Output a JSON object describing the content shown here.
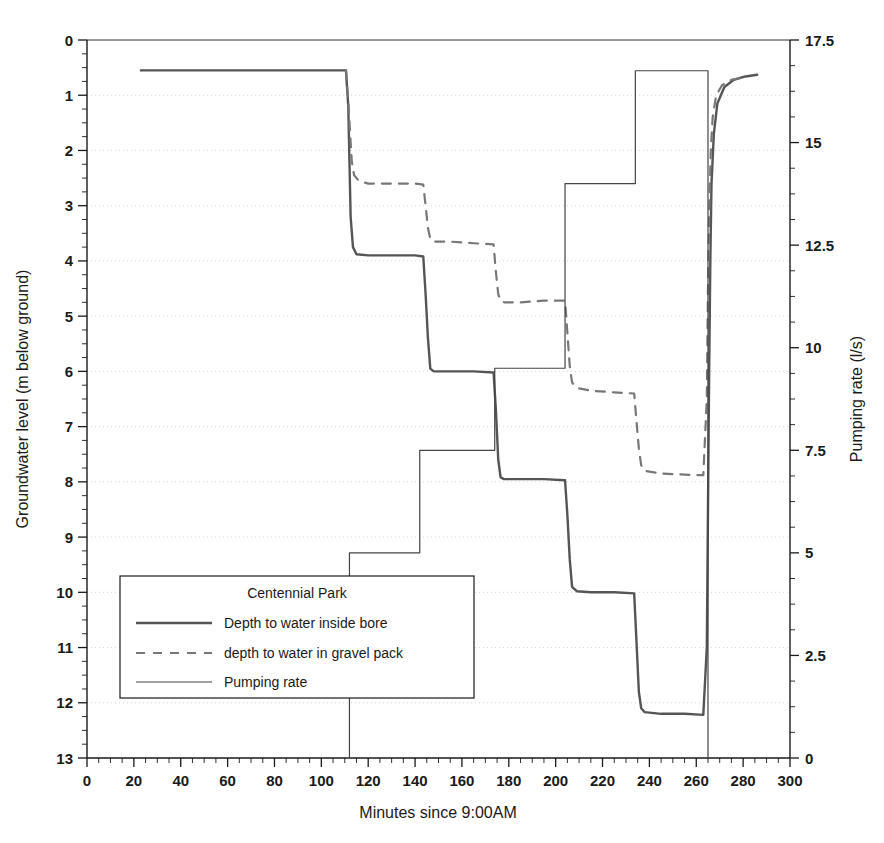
{
  "chart_data": {
    "type": "line",
    "title": "",
    "xlabel": "Minutes since 9:00AM",
    "ylabel_left": "Groundwater level (m below ground)",
    "ylabel_right": "Pumping rate (l/s)",
    "xlim": [
      0,
      300
    ],
    "xticks": [
      0,
      20,
      40,
      60,
      80,
      100,
      120,
      140,
      160,
      180,
      200,
      220,
      240,
      260,
      280,
      300
    ],
    "x_minor_tick_step": 5,
    "ylim_left": [
      0,
      13
    ],
    "yticks_left": [
      0,
      1,
      2,
      3,
      4,
      5,
      6,
      7,
      8,
      9,
      10,
      11,
      12,
      13
    ],
    "y_left_inverted": true,
    "y_left_minor_tick_step": 0.25,
    "ylim_right": [
      0,
      17.5
    ],
    "yticks_right": [
      0,
      2.5,
      5,
      7.5,
      10,
      12.5,
      15,
      17.5
    ],
    "y_right_minor_tick_step": 0.625,
    "grid": "horizontal-dotted",
    "legend_position": "lower-left-inside",
    "legend_title": "Centennial Park",
    "series": [
      {
        "name": "Depth to water inside bore",
        "axis": "left",
        "style": "solid",
        "width": 2.4,
        "color": "#555555",
        "points": [
          [
            23,
            0.55
          ],
          [
            60,
            0.55
          ],
          [
            100,
            0.55
          ],
          [
            110.5,
            0.55
          ],
          [
            111.5,
            1.2
          ],
          [
            112,
            2.2
          ],
          [
            112.5,
            3.2
          ],
          [
            113.5,
            3.75
          ],
          [
            115,
            3.88
          ],
          [
            120,
            3.9
          ],
          [
            130,
            3.9
          ],
          [
            140,
            3.9
          ],
          [
            143.5,
            3.92
          ],
          [
            144.5,
            4.6
          ],
          [
            145.5,
            5.4
          ],
          [
            146.5,
            5.95
          ],
          [
            148,
            6.0
          ],
          [
            155,
            6.0
          ],
          [
            165,
            6.0
          ],
          [
            173.5,
            6.02
          ],
          [
            174.5,
            6.7
          ],
          [
            175.5,
            7.6
          ],
          [
            176.5,
            7.92
          ],
          [
            178,
            7.95
          ],
          [
            185,
            7.95
          ],
          [
            195,
            7.95
          ],
          [
            204,
            7.97
          ],
          [
            205,
            8.6
          ],
          [
            206,
            9.4
          ],
          [
            207,
            9.9
          ],
          [
            209,
            9.98
          ],
          [
            215,
            10.0
          ],
          [
            225,
            10.0
          ],
          [
            233.5,
            10.02
          ],
          [
            234.5,
            10.9
          ],
          [
            235.5,
            11.8
          ],
          [
            236.5,
            12.1
          ],
          [
            238,
            12.17
          ],
          [
            245,
            12.2
          ],
          [
            255,
            12.2
          ],
          [
            263,
            12.22
          ],
          [
            264.5,
            11.0
          ],
          [
            265,
            8.5
          ],
          [
            265.5,
            6.0
          ],
          [
            266,
            4.0
          ],
          [
            266.5,
            2.6
          ],
          [
            267.5,
            1.7
          ],
          [
            269,
            1.15
          ],
          [
            272,
            0.85
          ],
          [
            276,
            0.72
          ],
          [
            281,
            0.66
          ],
          [
            286,
            0.63
          ]
        ]
      },
      {
        "name": "depth to water in gravel pack",
        "axis": "left",
        "style": "dashed",
        "width": 2.2,
        "color": "#777777",
        "points": [
          [
            110.5,
            0.55
          ],
          [
            111.5,
            1.1
          ],
          [
            112.3,
            1.7
          ],
          [
            113,
            2.2
          ],
          [
            114,
            2.45
          ],
          [
            116,
            2.55
          ],
          [
            120,
            2.6
          ],
          [
            130,
            2.6
          ],
          [
            140,
            2.6
          ],
          [
            143.5,
            2.62
          ],
          [
            144.5,
            3.0
          ],
          [
            145.5,
            3.4
          ],
          [
            146.5,
            3.6
          ],
          [
            148,
            3.65
          ],
          [
            155,
            3.65
          ],
          [
            165,
            3.68
          ],
          [
            173.5,
            3.7
          ],
          [
            174.5,
            4.2
          ],
          [
            175.5,
            4.6
          ],
          [
            176.5,
            4.72
          ],
          [
            178,
            4.75
          ],
          [
            185,
            4.75
          ],
          [
            195,
            4.72
          ],
          [
            204,
            4.72
          ],
          [
            205,
            5.3
          ],
          [
            206,
            5.9
          ],
          [
            207,
            6.2
          ],
          [
            209,
            6.3
          ],
          [
            215,
            6.35
          ],
          [
            225,
            6.38
          ],
          [
            233.5,
            6.4
          ],
          [
            234.5,
            6.9
          ],
          [
            235.5,
            7.4
          ],
          [
            236.5,
            7.7
          ],
          [
            238,
            7.8
          ],
          [
            245,
            7.85
          ],
          [
            255,
            7.87
          ],
          [
            263,
            7.88
          ],
          [
            264.5,
            6.5
          ],
          [
            265,
            4.5
          ],
          [
            265.6,
            3.0
          ],
          [
            266.2,
            2.0
          ],
          [
            267,
            1.4
          ],
          [
            268.5,
            1.0
          ],
          [
            271,
            0.82
          ],
          [
            275,
            0.72
          ],
          [
            280,
            0.68
          ]
        ]
      },
      {
        "name": "Pumping rate",
        "axis": "right",
        "style": "step",
        "width": 1.2,
        "color": "#444444",
        "points": [
          [
            112,
            0
          ],
          [
            112,
            5.0
          ],
          [
            142,
            5.0
          ],
          [
            142,
            7.5
          ],
          [
            174,
            7.5
          ],
          [
            174,
            9.5
          ],
          [
            204,
            9.5
          ],
          [
            204,
            14.0
          ],
          [
            234,
            14.0
          ],
          [
            234,
            16.75
          ],
          [
            265,
            16.75
          ],
          [
            265,
            0
          ]
        ]
      }
    ]
  },
  "legend": {
    "title": "Centennial Park",
    "entries": [
      {
        "label": "Depth to water inside bore",
        "style": "solid-thick"
      },
      {
        "label": "depth to water in gravel pack",
        "style": "dashed"
      },
      {
        "label": "Pumping rate",
        "style": "solid-thin"
      }
    ]
  },
  "axes": {
    "x": {
      "title": "Minutes since 9:00AM",
      "labels": [
        "0",
        "20",
        "40",
        "60",
        "80",
        "100",
        "120",
        "140",
        "160",
        "180",
        "200",
        "220",
        "240",
        "260",
        "280",
        "300"
      ]
    },
    "y_left": {
      "title": "Groundwater level (m below ground)",
      "labels": [
        "0",
        "1",
        "2",
        "3",
        "4",
        "5",
        "6",
        "7",
        "8",
        "9",
        "10",
        "11",
        "12",
        "13"
      ]
    },
    "y_right": {
      "title": "Pumping rate (l/s)",
      "labels": [
        "0",
        "2.5",
        "5",
        "7.5",
        "10",
        "12.5",
        "15",
        "17.5"
      ]
    }
  },
  "colors": {
    "axis": "#1a1a1a",
    "grid": "#c9c9d6",
    "bore": "#555555",
    "gravel": "#777777",
    "pumping": "#444444",
    "background": "#ffffff"
  }
}
